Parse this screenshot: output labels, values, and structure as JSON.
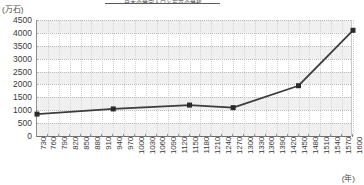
{
  "chart": {
    "title": "日本の推定人口と石高の推移",
    "y_unit_label": "(万石)",
    "x_unit_label": "(年)"
  },
  "chart_data": {
    "type": "line",
    "title": "日本の推定人口と石高の推移",
    "xlabel": "(年)",
    "ylabel": "(万石)",
    "ylim": [
      0,
      4500
    ],
    "ytick_step": 500,
    "yticks": [
      "4500",
      "4000",
      "3500",
      "3000",
      "2500",
      "2000",
      "1500",
      "1000",
      "500",
      "0"
    ],
    "xlim": [
      730,
      1600
    ],
    "xtick_step": 30,
    "xticks": [
      "730",
      "760",
      "790",
      "820",
      "850",
      "880",
      "910",
      "940",
      "970",
      "1000",
      "1030",
      "1060",
      "1090",
      "1120",
      "1150",
      "1180",
      "1210",
      "1240",
      "1270",
      "1300",
      "1330",
      "1360",
      "1390",
      "1420",
      "1450",
      "1480",
      "1510",
      "1540",
      "1570",
      "1600"
    ],
    "grid": true,
    "legend": "none",
    "marker": "square",
    "series": [
      {
        "name": "石高",
        "points": [
          {
            "x": 730,
            "y": 850
          },
          {
            "x": 940,
            "y": 1050
          },
          {
            "x": 1150,
            "y": 1200
          },
          {
            "x": 1270,
            "y": 1100
          },
          {
            "x": 1450,
            "y": 1950
          },
          {
            "x": 1600,
            "y": 4100
          }
        ]
      }
    ]
  },
  "colors": {
    "line": "#3c3c3c",
    "marker": "#2b2b2b",
    "gridline": "#b9b9b9",
    "band": "#f0f0f0",
    "axis": "#6e6e6e",
    "text": "#3a3a3a"
  }
}
